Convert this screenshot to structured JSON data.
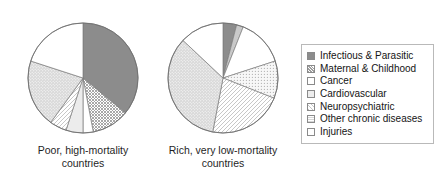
{
  "figure": {
    "background_color": "#ffffff",
    "text_color": "#1a1a1a"
  },
  "legend": {
    "name": "cause-of-death-legend",
    "border_color": "#b9b9b9",
    "entries": [
      {
        "label": "Infectious & Parasitic",
        "swatch": "solid-dark-gray",
        "color": "#8c8c8c"
      },
      {
        "label": "Maternal & Childhood",
        "swatch": "cross-hatch-gray",
        "color": "#bdbdbd"
      },
      {
        "label": "Cancer",
        "swatch": "solid-white",
        "color": "#ffffff"
      },
      {
        "label": "Cardiovascular",
        "swatch": "light-gray-fill",
        "color": "#ededed"
      },
      {
        "label": "Neuropsychiatric",
        "swatch": "diagonal-hatch",
        "color": "#f2f2f2"
      },
      {
        "label": "Other chronic diseases",
        "swatch": "fine-dot-gray",
        "color": "#d6d6d6"
      },
      {
        "label": "Injuries",
        "swatch": "outline-white",
        "color": "#ffffff"
      }
    ]
  },
  "charts": [
    {
      "id": "poor-high-mortality",
      "caption": "Poor, high-mortality\ncountries",
      "center": {
        "cx": 77,
        "cy": 62
      },
      "radius": 55
    },
    {
      "id": "rich-very-low-mortality",
      "caption": "Rich, very low-mortality\ncountries",
      "center": {
        "cx": 77,
        "cy": 62
      },
      "radius": 55
    }
  ],
  "chart_data": [
    {
      "type": "pie",
      "title": "Poor, high-mortality countries",
      "categories": [
        "Infectious & Parasitic",
        "Maternal & Childhood",
        "Cancer",
        "Cardiovascular",
        "Neuropsychiatric",
        "Other chronic diseases",
        "Injuries"
      ],
      "values": [
        36,
        11,
        3,
        5,
        5,
        20,
        20
      ],
      "units": "percent of deaths",
      "start_angle": 0,
      "direction": "clockwise",
      "legend_position": "right",
      "grid": false
    },
    {
      "type": "pie",
      "title": "Rich, very low-mortality countries",
      "categories": [
        "Infectious & Parasitic",
        "Maternal & Childhood",
        "Cancer",
        "Cardiovascular",
        "Neuropsychiatric",
        "Other chronic diseases",
        "Injuries"
      ],
      "values": [
        4,
        2,
        14,
        11,
        22,
        34,
        13
      ],
      "units": "percent of deaths",
      "start_angle": 0,
      "direction": "clockwise",
      "legend_position": "right",
      "grid": false
    }
  ]
}
